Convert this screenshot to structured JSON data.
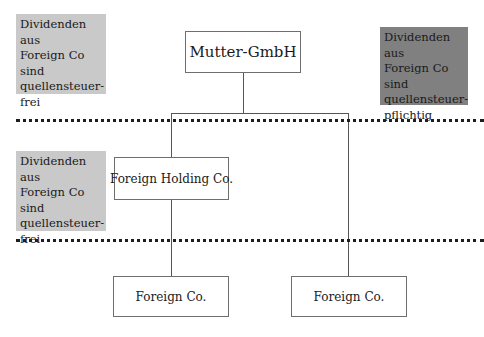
{
  "diagram": {
    "notes": {
      "top_left": {
        "lines": [
          "Dividenden aus",
          "Foreign Co",
          "sind",
          "quellensteuer-",
          "frei"
        ],
        "fill": "#c9c9c9"
      },
      "top_right": {
        "lines": [
          "Dividenden aus",
          "Foreign Co",
          "sind",
          "quellensteuer-",
          "pflichtig"
        ],
        "fill": "#808080"
      },
      "middle_left": {
        "lines": [
          "Dividenden aus",
          "Foreign Co",
          "sind",
          "quellensteuer-",
          "frei"
        ],
        "fill": "#c9c9c9"
      }
    },
    "entities": {
      "parent": "Mutter-GmbH",
      "holding": "Foreign Holding Co.",
      "sub_left": "Foreign Co.",
      "sub_right": "Foreign Co."
    },
    "separators": [
      "dotted-line-1",
      "dotted-line-2"
    ]
  }
}
